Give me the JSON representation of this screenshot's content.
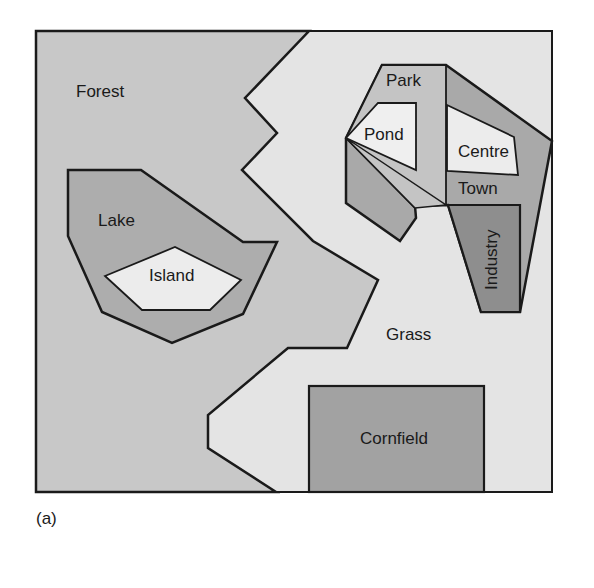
{
  "figure": {
    "caption": "(a)",
    "regions": {
      "forest": "Forest",
      "grass": "Grass",
      "lake": "Lake",
      "island": "Island",
      "park": "Park",
      "pond": "Pond",
      "centre": "Centre",
      "town": "Town",
      "industry": "Industry",
      "cornfield": "Cornfield"
    },
    "colors": {
      "forest": "#c8c8c8",
      "grass": "#e4e4e4",
      "lake": "#adadad",
      "island": "#ececec",
      "park": "#c4c4c4",
      "pond": "#efefef",
      "town": "#a9a9a9",
      "centre": "#ececec",
      "industry": "#8e8e8e",
      "cornfield": "#a2a2a2",
      "outline": "#1a1a1a"
    }
  }
}
